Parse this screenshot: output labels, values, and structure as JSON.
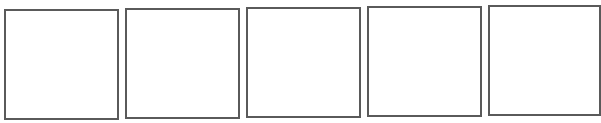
{
  "header": {
    "clipped_text": "",
    "note": ""
  },
  "frames": [
    {
      "label": "",
      "x": 4,
      "y": 9
    },
    {
      "label": "",
      "x": 125,
      "y": 8
    },
    {
      "label": "",
      "x": 246,
      "y": 7
    },
    {
      "label": "",
      "x": 367,
      "y": 6
    },
    {
      "label": "",
      "x": 488,
      "y": 5
    }
  ],
  "colors": {
    "border": "#5a5a5a",
    "background": "#ffffff"
  }
}
